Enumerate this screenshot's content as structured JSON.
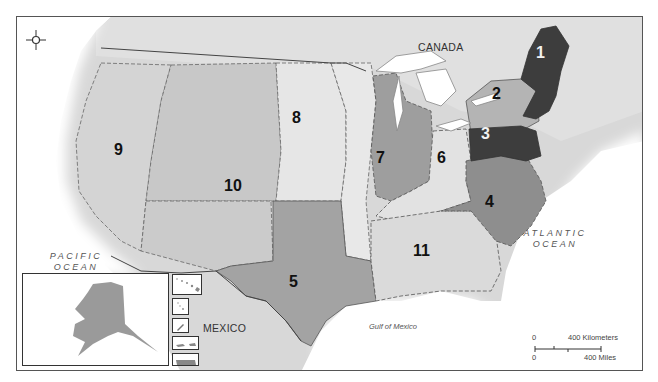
{
  "map": {
    "title": "Federal Regions of the United States",
    "country_labels": {
      "canada": "CANADA",
      "mexico": "MEXICO"
    },
    "water_labels": {
      "pacific_line1": "PACIFIC",
      "pacific_line2": "OCEAN",
      "atlantic_line1": "ATLANTIC",
      "atlantic_line2": "OCEAN",
      "gulf": "Gulf of Mexico"
    },
    "regions": [
      {
        "id": "1",
        "label": "1",
        "color": "#3d3d3d",
        "text_color": "#f2f2f2"
      },
      {
        "id": "2",
        "label": "2",
        "color": "#b4b4b4",
        "text_color": "#111111"
      },
      {
        "id": "3",
        "label": "3",
        "color": "#3d3d3d",
        "text_color": "#f2f2f2"
      },
      {
        "id": "4",
        "label": "4",
        "color": "#8e8e8e",
        "text_color": "#111111"
      },
      {
        "id": "5",
        "label": "5",
        "color": "#a3a3a3",
        "text_color": "#111111"
      },
      {
        "id": "6",
        "label": "6",
        "color": "#e2e2e2",
        "text_color": "#111111"
      },
      {
        "id": "7",
        "label": "7",
        "color": "#9e9e9e",
        "text_color": "#111111"
      },
      {
        "id": "8",
        "label": "8",
        "color": "#e6e6e6",
        "text_color": "#111111"
      },
      {
        "id": "9",
        "label": "9",
        "color": "#d4d4d4",
        "text_color": "#111111"
      },
      {
        "id": "10",
        "label": "10",
        "color": "#c6c6c6",
        "text_color": "#111111"
      },
      {
        "id": "11",
        "label": "11",
        "color": "#dadada",
        "text_color": "#111111"
      }
    ],
    "scale_bar": {
      "zero_km": "0",
      "km_label": "400 Kilometers",
      "zero_mi": "0",
      "mi_label": "400 Miles"
    },
    "insets": [
      "Alaska",
      "Hawaii",
      "Northern Mariana Islands / Guam",
      "American Samoa",
      "U.S. Virgin Islands",
      "Puerto Rico"
    ],
    "compass": "compass-rose"
  }
}
